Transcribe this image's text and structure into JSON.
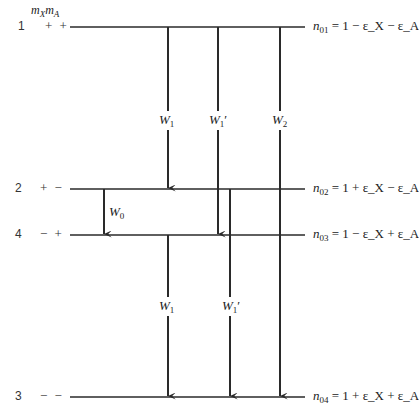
{
  "header": {
    "column_label": "m_X m_A"
  },
  "levels": [
    {
      "id": "1",
      "signs": "+ +",
      "y": 27,
      "n_label": "n",
      "n_sub": "01",
      "eq_rhs": "= 1 − ε_X − ε_A"
    },
    {
      "id": "2",
      "signs": "+ −",
      "y": 189,
      "n_label": "n",
      "n_sub": "02",
      "eq_rhs": "= 1 + ε_X − ε_A"
    },
    {
      "id": "4",
      "signs": "− +",
      "y": 235,
      "n_label": "n",
      "n_sub": "03",
      "eq_rhs": "= 1 − ε_X + ε_A"
    },
    {
      "id": "3",
      "signs": "− −",
      "y": 397,
      "n_label": "n",
      "n_sub": "04",
      "eq_rhs": "= 1 + ε_X + ε_A"
    }
  ],
  "transitions": [
    {
      "label": "W",
      "sub": "1",
      "prime": "",
      "from": "1",
      "to": "2",
      "x": 168
    },
    {
      "label": "W",
      "sub": "1",
      "prime": "′",
      "from": "1",
      "to": "4",
      "x": 218
    },
    {
      "label": "W",
      "sub": "2",
      "prime": "",
      "from": "1",
      "to": "3",
      "x": 280
    },
    {
      "label": "W",
      "sub": "0",
      "prime": "",
      "from": "2",
      "to": "4",
      "x": 104
    },
    {
      "label": "W",
      "sub": "1",
      "prime": "",
      "from": "4",
      "to": "3",
      "x": 168
    },
    {
      "label": "W",
      "sub": "1",
      "prime": "′",
      "from": "2",
      "to": "3",
      "x": 230
    }
  ],
  "colors": {
    "line": "#2a2a2a",
    "text": "#222222",
    "background": "#ffffff"
  }
}
